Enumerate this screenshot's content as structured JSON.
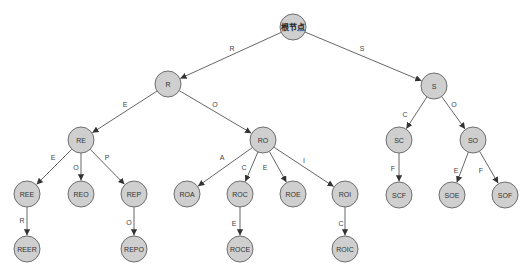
{
  "diagram": {
    "type": "trie",
    "colors": {
      "node_fill": "#cfcfcf",
      "node_stroke": "#6e6e6e",
      "edge": "#555555",
      "background": "#ffffff"
    },
    "node_radius": 13,
    "nodes": [
      {
        "id": "root",
        "label": "根节点",
        "x": 293,
        "y": 27
      },
      {
        "id": "R",
        "label": "R",
        "x": 168,
        "y": 84
      },
      {
        "id": "S",
        "label": "S",
        "x": 434,
        "y": 86
      },
      {
        "id": "RE",
        "label": "RE",
        "x": 81,
        "y": 140
      },
      {
        "id": "RO",
        "label": "RO",
        "x": 263,
        "y": 140
      },
      {
        "id": "SC",
        "label": "SC",
        "x": 399,
        "y": 140
      },
      {
        "id": "SO",
        "label": "SO",
        "x": 473,
        "y": 140
      },
      {
        "id": "REE",
        "label": "REE",
        "x": 27,
        "y": 194
      },
      {
        "id": "REO",
        "label": "REO",
        "x": 81,
        "y": 194
      },
      {
        "id": "REP",
        "label": "REP",
        "x": 134,
        "y": 194
      },
      {
        "id": "ROA",
        "label": "ROA",
        "x": 187,
        "y": 194
      },
      {
        "id": "ROC",
        "label": "ROC",
        "x": 240,
        "y": 194
      },
      {
        "id": "ROE",
        "label": "ROE",
        "x": 293,
        "y": 194
      },
      {
        "id": "ROI",
        "label": "ROI",
        "x": 345,
        "y": 194
      },
      {
        "id": "SCF",
        "label": "SCF",
        "x": 399,
        "y": 195
      },
      {
        "id": "SOE",
        "label": "SOE",
        "x": 452,
        "y": 195
      },
      {
        "id": "SOF",
        "label": "SOF",
        "x": 505,
        "y": 195
      },
      {
        "id": "REER",
        "label": "REER",
        "x": 27,
        "y": 249
      },
      {
        "id": "REPO",
        "label": "REPO",
        "x": 134,
        "y": 249
      },
      {
        "id": "ROCE",
        "label": "ROCE",
        "x": 240,
        "y": 249
      },
      {
        "id": "ROIC",
        "label": "ROIC",
        "x": 345,
        "y": 249
      }
    ],
    "edges": [
      {
        "from": "root",
        "to": "R",
        "label": "R",
        "lx": 232,
        "ly": 48
      },
      {
        "from": "root",
        "to": "S",
        "label": "S",
        "lx": 362,
        "ly": 48
      },
      {
        "from": "R",
        "to": "RE",
        "label": "E",
        "lx": 125,
        "ly": 104
      },
      {
        "from": "R",
        "to": "RO",
        "label": "O",
        "lx": 215,
        "ly": 104
      },
      {
        "from": "S",
        "to": "SC",
        "label": "C",
        "lx": 405,
        "ly": 114
      },
      {
        "from": "S",
        "to": "SO",
        "label": "O",
        "lx": 454,
        "ly": 104
      },
      {
        "from": "RE",
        "to": "REE",
        "label": "E",
        "lx": 53,
        "ly": 157
      },
      {
        "from": "RE",
        "to": "REO",
        "label": "O",
        "lx": 76,
        "ly": 167
      },
      {
        "from": "RE",
        "to": "REP",
        "label": "P",
        "lx": 107,
        "ly": 157
      },
      {
        "from": "RO",
        "to": "ROA",
        "label": "A",
        "lx": 222,
        "ly": 157
      },
      {
        "from": "RO",
        "to": "ROC",
        "label": "C",
        "lx": 244,
        "ly": 167
      },
      {
        "from": "RO",
        "to": "ROE",
        "label": "E",
        "lx": 265,
        "ly": 167
      },
      {
        "from": "RO",
        "to": "ROI",
        "label": "I",
        "lx": 304,
        "ly": 160
      },
      {
        "from": "SC",
        "to": "SCF",
        "label": "F",
        "lx": 393,
        "ly": 168
      },
      {
        "from": "SO",
        "to": "SOE",
        "label": "E",
        "lx": 456,
        "ly": 170
      },
      {
        "from": "SO",
        "to": "SOF",
        "label": "F",
        "lx": 481,
        "ly": 170
      },
      {
        "from": "REE",
        "to": "REER",
        "label": "R",
        "lx": 22,
        "ly": 220
      },
      {
        "from": "REP",
        "to": "REPO",
        "label": "O",
        "lx": 129,
        "ly": 222
      },
      {
        "from": "ROC",
        "to": "ROCE",
        "label": "E",
        "lx": 234,
        "ly": 223
      },
      {
        "from": "ROI",
        "to": "ROIC",
        "label": "C",
        "lx": 341,
        "ly": 223
      }
    ]
  }
}
